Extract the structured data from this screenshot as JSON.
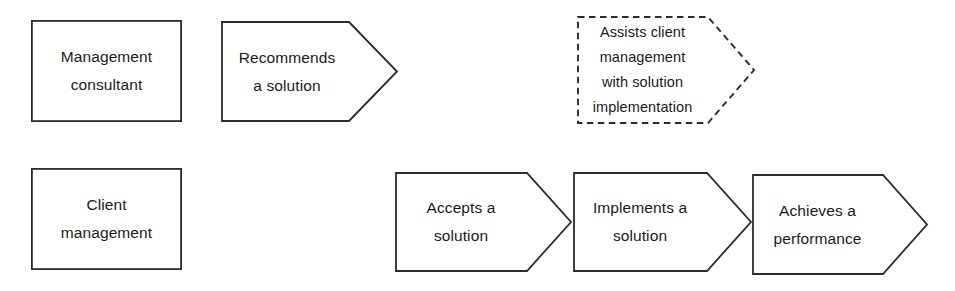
{
  "diagram": {
    "type": "process-flow",
    "title": "",
    "background_color": "#ffffff",
    "stroke_color": "#2b2b2b",
    "text_color": "#1a1a1a",
    "rows": [
      {
        "name": "management-consultant-row",
        "actor": "Management consultant",
        "steps": [
          "Recommends a solution",
          "Assists client management with solution implementation"
        ]
      },
      {
        "name": "client-management-row",
        "actor": "Client management",
        "steps": [
          "Accepts a solution",
          "Implements a solution",
          "Achieves a performance"
        ]
      }
    ]
  },
  "shapes": {
    "actor_consultant": {
      "name": "management-consultant-box",
      "kind": "rectangle",
      "border_style": "solid",
      "lines": [
        "Management",
        "consultant"
      ]
    },
    "actor_client": {
      "name": "client-management-box",
      "kind": "rectangle",
      "border_style": "solid",
      "lines": [
        "Client",
        "management"
      ]
    },
    "step_recommends": {
      "name": "recommends-a-solution-chevron",
      "kind": "chevron",
      "border_style": "solid",
      "lines": [
        "Recommends",
        "a solution"
      ]
    },
    "step_assists": {
      "name": "assists-client-management-chevron",
      "kind": "chevron",
      "border_style": "dashed",
      "lines": [
        "Assists client",
        "management",
        "with solution",
        "implementation"
      ]
    },
    "step_accepts": {
      "name": "accepts-a-solution-chevron",
      "kind": "chevron",
      "border_style": "solid",
      "lines": [
        "Accepts a",
        "solution"
      ]
    },
    "step_implements": {
      "name": "implements-a-solution-chevron",
      "kind": "chevron",
      "border_style": "solid",
      "lines": [
        "Implements a",
        "solution"
      ]
    },
    "step_achieves": {
      "name": "achieves-a-performance-chevron",
      "kind": "chevron",
      "border_style": "solid",
      "lines": [
        "Achieves a",
        "performance"
      ]
    }
  }
}
